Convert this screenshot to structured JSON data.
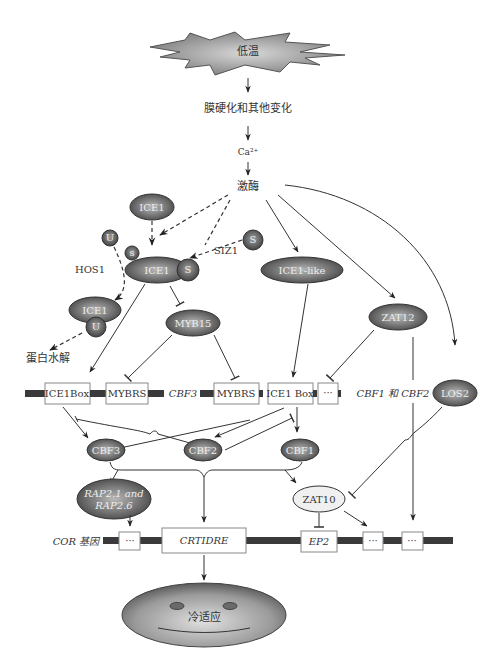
{
  "stimulus": {
    "label": "低温"
  },
  "steps": {
    "membrane": "膜硬化和其他变化",
    "calcium": "Ca²⁺",
    "kinase": "激酶"
  },
  "proteins": {
    "ice1_top": "ICE1",
    "ice1_center": "ICE1",
    "ice1_degraded": "ICE1",
    "ice1_like": "ICE1-like",
    "myb15": "MYB15",
    "zat12": "ZAT12",
    "los2": "LOS2",
    "cbf3": "CBF3",
    "cbf2": "CBF2",
    "cbf1": "CBF1",
    "rap": "RAP2.1 and RAP2.6",
    "rap_line1": "RAP2.1 and",
    "rap_line2": "RAP2.6",
    "zat10": "ZAT10"
  },
  "modifiers": {
    "ubiquitin": "U",
    "sumo": "S",
    "hos1": "HOS1",
    "siz1": "SIZ1",
    "degradation": "蛋白水解"
  },
  "promoter_row": {
    "elements": [
      "ICE1Box",
      "MYBRS",
      "MYBRS",
      "ICE1 Box",
      "···"
    ],
    "gene_cbf3": "CBF3",
    "gene_cbf12": "CBF1 和 CBF2"
  },
  "cor_row": {
    "label": "COR 基因",
    "elements": [
      "···",
      "CRTIDRE",
      "EP2",
      "···",
      "···"
    ]
  },
  "outcome": {
    "label": "冷适应"
  },
  "colors": {
    "node_fill_dark": "#4a4a4a",
    "node_fill_light": "#9a9a9a",
    "zat10_fill": "#f0f0f0",
    "line": "#333333",
    "bar": "#3a3a3a"
  }
}
